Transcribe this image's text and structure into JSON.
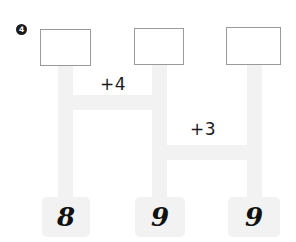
{
  "worksheet": {
    "question_number": "4",
    "width": 296,
    "height": 242,
    "background_color": "#ffffff",
    "bar_color": "#f2f2f2",
    "box_border_color": "#9a9a9a",
    "text_color": "#1a1a1a"
  },
  "answer_boxes": [
    {
      "id": "box-1",
      "value": "",
      "placeholder": ""
    },
    {
      "id": "box-2",
      "value": "",
      "placeholder": ""
    },
    {
      "id": "box-3",
      "value": "",
      "placeholder": ""
    }
  ],
  "operations": [
    {
      "id": "op-1",
      "label": "+4"
    },
    {
      "id": "op-2",
      "label": "+3"
    }
  ],
  "number_tiles": [
    {
      "id": "tile-1",
      "label": "8"
    },
    {
      "id": "tile-2",
      "label": "9"
    },
    {
      "id": "tile-3",
      "label": "9"
    }
  ]
}
